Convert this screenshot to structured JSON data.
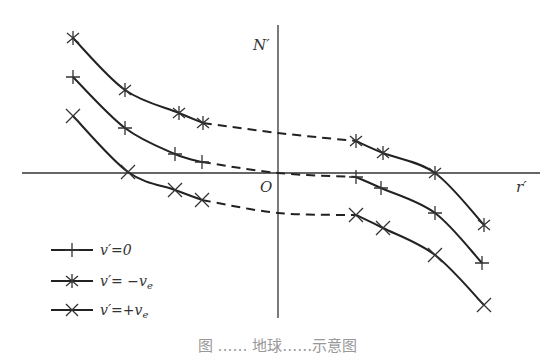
{
  "chart_data": {
    "type": "line",
    "title": "",
    "xlabel": "r′",
    "ylabel": "N′",
    "origin_label": "O",
    "grid": false,
    "legend_position": "lower-left",
    "note": "Schematic curves; solid segments with markers at outer regions, dashed segments connecting through the center. Coordinates in pixel-space relative to origin (x right, y up).",
    "series": [
      {
        "name": "v′=0",
        "marker": "plus",
        "points_left": [
          [
            -205,
            96
          ],
          [
            -153,
            45
          ],
          [
            -103,
            19
          ],
          [
            -76,
            11
          ]
        ],
        "dashed_mid": [
          [
            -76,
            11
          ],
          [
            0,
            0
          ],
          [
            78,
            -4
          ]
        ],
        "points_right": [
          [
            78,
            -4
          ],
          [
            103,
            -15
          ],
          [
            157,
            -40
          ],
          [
            204,
            -90
          ]
        ]
      },
      {
        "name": "v′=−ve",
        "marker": "asterisk",
        "points_left": [
          [
            -205,
            135
          ],
          [
            -153,
            83
          ],
          [
            -99,
            60
          ],
          [
            -75,
            50
          ]
        ],
        "dashed_mid": [
          [
            -75,
            50
          ],
          [
            0,
            40
          ],
          [
            78,
            32
          ]
        ],
        "points_right": [
          [
            78,
            32
          ],
          [
            105,
            20
          ],
          [
            157,
            0
          ],
          [
            206,
            -52
          ]
        ]
      },
      {
        "name": "v′=+ve",
        "marker": "cross",
        "points_left": [
          [
            -205,
            57
          ],
          [
            -150,
            1
          ],
          [
            -103,
            -17
          ],
          [
            -76,
            -27
          ]
        ],
        "dashed_mid": [
          [
            -76,
            -27
          ],
          [
            0,
            -40
          ],
          [
            78,
            -42
          ]
        ],
        "points_right": [
          [
            78,
            -42
          ],
          [
            105,
            -55
          ],
          [
            157,
            -82
          ],
          [
            206,
            -132
          ]
        ]
      }
    ]
  },
  "labels": {
    "y_axis": "N′",
    "x_axis": "r′",
    "origin": "O"
  },
  "legend": [
    {
      "marker": "plus",
      "text": "v′=0"
    },
    {
      "marker": "asterisk",
      "text": "v′= −v",
      "sub": "e"
    },
    {
      "marker": "cross",
      "text": "v′=+v",
      "sub": "e"
    }
  ],
  "caption": "图 …… 地球……示意图"
}
